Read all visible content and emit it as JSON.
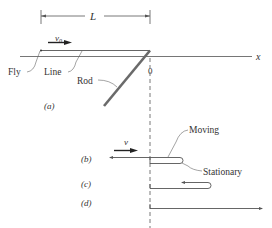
{
  "diagram": {
    "dimension_label": "L",
    "velocity_a": "v",
    "velocity_a_sub": "0",
    "axis_label": "x",
    "origin_label": "0",
    "labels": {
      "fly": "Fly",
      "line": "Line",
      "rod": "Rod",
      "moving": "Moving",
      "stationary": "Stationary"
    },
    "parts": {
      "a": "(a)",
      "b": "(b)",
      "c": "(c)",
      "d": "(d)"
    },
    "velocity_b": "v",
    "colors": {
      "line": "#555555",
      "rod": "#6a6a6a",
      "arrow": "#222222"
    }
  }
}
